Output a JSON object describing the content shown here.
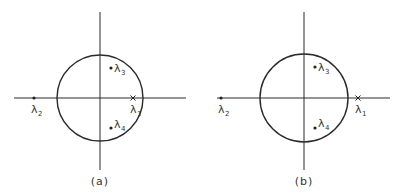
{
  "figures": [
    {
      "id": "a",
      "caption": "(a)",
      "axes": {
        "cx": 100,
        "cy": 98,
        "x_from": 14,
        "x_to": 186,
        "y_from": 12,
        "y_to": 170
      },
      "unit_circle": {
        "cx": 100,
        "cy": 98,
        "r": 43
      },
      "eigenvalues": [
        {
          "name": "λ",
          "sub": "1",
          "marker": "cross",
          "x": 133,
          "y": 98,
          "label_x": 130,
          "label_y": 113,
          "position": "on real axis, inside unit circle"
        },
        {
          "name": "λ",
          "sub": "2",
          "marker": "dot",
          "x": 34,
          "y": 98,
          "label_x": 31,
          "label_y": 113,
          "position": "on negative real axis, outside unit circle"
        },
        {
          "name": "λ",
          "sub": "3",
          "marker": "dot",
          "x": 111,
          "y": 68,
          "label_x": 114,
          "label_y": 72,
          "position": "upper half, inside unit circle"
        },
        {
          "name": "λ",
          "sub": "4",
          "marker": "dot",
          "x": 111,
          "y": 128,
          "label_x": 114,
          "label_y": 128,
          "position": "lower half, inside unit circle"
        }
      ]
    },
    {
      "id": "b",
      "caption": "(b)",
      "axes": {
        "cx": 304,
        "cy": 98,
        "x_from": 217,
        "x_to": 390,
        "y_from": 12,
        "y_to": 170
      },
      "unit_circle": {
        "cx": 304,
        "cy": 98,
        "r": 44
      },
      "eigenvalues": [
        {
          "name": "λ",
          "sub": "1",
          "marker": "cross",
          "x": 358,
          "y": 98,
          "label_x": 355,
          "label_y": 113,
          "position": "on real axis, outside unit circle"
        },
        {
          "name": "λ",
          "sub": "2",
          "marker": "dot",
          "x": 221,
          "y": 98,
          "label_x": 218,
          "label_y": 113,
          "position": "on negative real axis, outside unit circle"
        },
        {
          "name": "λ",
          "sub": "3",
          "marker": "dot",
          "x": 315,
          "y": 67,
          "label_x": 318,
          "label_y": 71,
          "position": "upper half, inside unit circle"
        },
        {
          "name": "λ",
          "sub": "4",
          "marker": "dot",
          "x": 315,
          "y": 128,
          "label_x": 318,
          "label_y": 127,
          "position": "lower half, inside unit circle"
        }
      ]
    }
  ]
}
